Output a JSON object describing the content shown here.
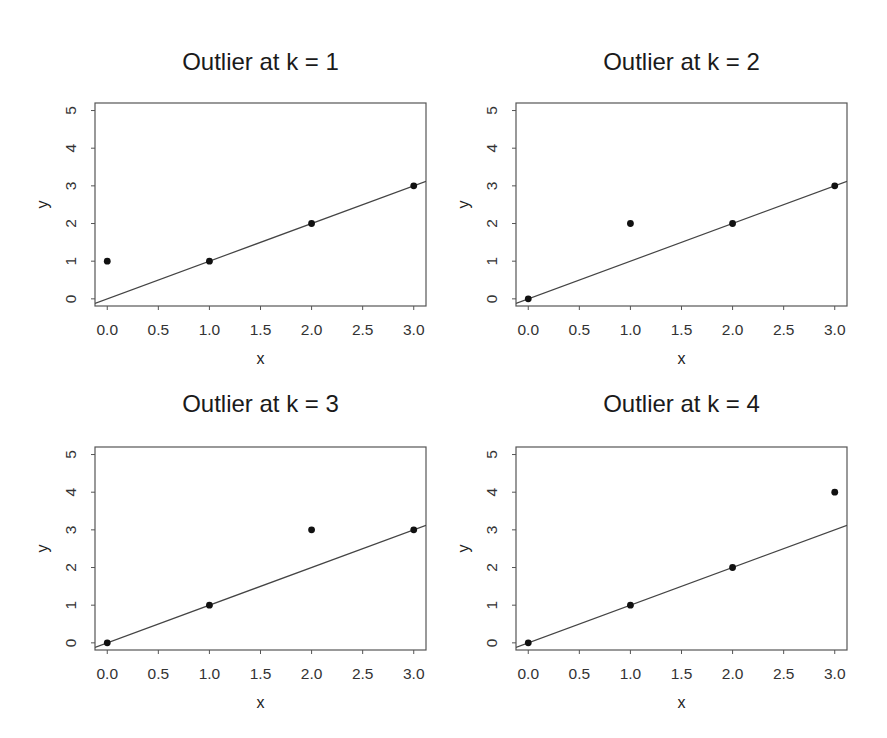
{
  "figure": {
    "width": 887,
    "height": 738,
    "colors": {
      "background": "#ffffff",
      "axis": "#555555",
      "points": "#111111",
      "fit_line": "#444444",
      "text": "#1a1a1a"
    }
  },
  "chart_data": [
    {
      "type": "scatter",
      "title": "Outlier at k = 1",
      "xlabel": "x",
      "ylabel": "y",
      "xlim": [
        -0.12,
        3.12
      ],
      "ylim": [
        -0.19,
        5.2
      ],
      "xticks": [
        0.0,
        0.5,
        1.0,
        1.5,
        2.0,
        2.5,
        3.0
      ],
      "xtick_labels": [
        "0.0",
        "0.5",
        "1.0",
        "1.5",
        "2.0",
        "2.5",
        "3.0"
      ],
      "yticks": [
        0,
        1,
        2,
        3,
        4,
        5
      ],
      "ytick_labels": [
        "0",
        "1",
        "2",
        "3",
        "4",
        "5"
      ],
      "grid": false,
      "legend": null,
      "points": {
        "x": [
          0,
          1,
          2,
          3
        ],
        "y": [
          1,
          1,
          2,
          3
        ]
      },
      "fit_line": {
        "intercept": 0,
        "slope": 1
      }
    },
    {
      "type": "scatter",
      "title": "Outlier at k = 2",
      "xlabel": "x",
      "ylabel": "y",
      "xlim": [
        -0.12,
        3.12
      ],
      "ylim": [
        -0.19,
        5.2
      ],
      "xticks": [
        0.0,
        0.5,
        1.0,
        1.5,
        2.0,
        2.5,
        3.0
      ],
      "xtick_labels": [
        "0.0",
        "0.5",
        "1.0",
        "1.5",
        "2.0",
        "2.5",
        "3.0"
      ],
      "yticks": [
        0,
        1,
        2,
        3,
        4,
        5
      ],
      "ytick_labels": [
        "0",
        "1",
        "2",
        "3",
        "4",
        "5"
      ],
      "grid": false,
      "legend": null,
      "points": {
        "x": [
          0,
          1,
          2,
          3
        ],
        "y": [
          0,
          2,
          2,
          3
        ]
      },
      "fit_line": {
        "intercept": 0,
        "slope": 1
      }
    },
    {
      "type": "scatter",
      "title": "Outlier at k = 3",
      "xlabel": "x",
      "ylabel": "y",
      "xlim": [
        -0.12,
        3.12
      ],
      "ylim": [
        -0.19,
        5.2
      ],
      "xticks": [
        0.0,
        0.5,
        1.0,
        1.5,
        2.0,
        2.5,
        3.0
      ],
      "xtick_labels": [
        "0.0",
        "0.5",
        "1.0",
        "1.5",
        "2.0",
        "2.5",
        "3.0"
      ],
      "yticks": [
        0,
        1,
        2,
        3,
        4,
        5
      ],
      "ytick_labels": [
        "0",
        "1",
        "2",
        "3",
        "4",
        "5"
      ],
      "grid": false,
      "legend": null,
      "points": {
        "x": [
          0,
          1,
          2,
          3
        ],
        "y": [
          0,
          1,
          3,
          3
        ]
      },
      "fit_line": {
        "intercept": 0,
        "slope": 1
      }
    },
    {
      "type": "scatter",
      "title": "Outlier at k = 4",
      "xlabel": "x",
      "ylabel": "y",
      "xlim": [
        -0.12,
        3.12
      ],
      "ylim": [
        -0.19,
        5.2
      ],
      "xticks": [
        0.0,
        0.5,
        1.0,
        1.5,
        2.0,
        2.5,
        3.0
      ],
      "xtick_labels": [
        "0.0",
        "0.5",
        "1.0",
        "1.5",
        "2.0",
        "2.5",
        "3.0"
      ],
      "yticks": [
        0,
        1,
        2,
        3,
        4,
        5
      ],
      "ytick_labels": [
        "0",
        "1",
        "2",
        "3",
        "4",
        "5"
      ],
      "grid": false,
      "legend": null,
      "points": {
        "x": [
          0,
          1,
          2,
          3
        ],
        "y": [
          0,
          1,
          2,
          4
        ]
      },
      "fit_line": {
        "intercept": 0,
        "slope": 1
      }
    }
  ],
  "layout": {
    "panels": [
      {
        "left": 0,
        "top": 0,
        "box": {
          "x0": 95,
          "y0": 103,
          "x1": 426,
          "y1": 306
        },
        "title_y": 70,
        "tick_label_y": 335,
        "xlabel_y": 364,
        "ylabel_x": 48,
        "ytick_label_x": 76
      },
      {
        "left": 443,
        "top": 0,
        "box": {
          "x0": 73,
          "y0": 103,
          "x1": 404,
          "y1": 306
        },
        "title_y": 70,
        "tick_label_y": 335,
        "xlabel_y": 364,
        "ylabel_x": 26,
        "ytick_label_x": 54
      },
      {
        "left": 0,
        "top": 369,
        "box": {
          "x0": 95,
          "y0": 78,
          "x1": 426,
          "y1": 281
        },
        "title_y": 43,
        "tick_label_y": 310,
        "xlabel_y": 339,
        "ylabel_x": 48,
        "ytick_label_x": 76
      },
      {
        "left": 443,
        "top": 369,
        "box": {
          "x0": 73,
          "y0": 78,
          "x1": 404,
          "y1": 281
        },
        "title_y": 43,
        "tick_label_y": 310,
        "xlabel_y": 339,
        "ylabel_x": 26,
        "ytick_label_x": 54
      }
    ]
  }
}
